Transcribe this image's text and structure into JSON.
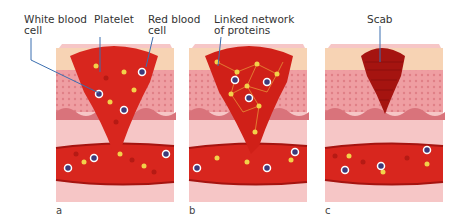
{
  "figure": {
    "panels": [
      {
        "id": "a",
        "label": "a",
        "stage": "clot forming"
      },
      {
        "id": "b",
        "label": "b",
        "stage": "protein network"
      },
      {
        "id": "c",
        "label": "c",
        "stage": "scab"
      }
    ],
    "labels": {
      "white_blood_cell_line1": "White blood",
      "white_blood_cell_line2": "cell",
      "platelet": "Platelet",
      "red_blood_cell_line1": "Red blood",
      "red_blood_cell_line2": "cell",
      "linked_network_line1": "Linked network",
      "linked_network_line2": "of proteins",
      "scab": "Scab"
    },
    "colors": {
      "blood": "#d8261e",
      "blood_dark": "#a51410",
      "skin_surface": "#f7d3b4",
      "dermis": "#ef9ea2",
      "tissue": "#f6c6c6",
      "leader_line": "#3b6fb0",
      "platelet": "#f2d24a",
      "wbc": "#3e3a7a"
    }
  }
}
